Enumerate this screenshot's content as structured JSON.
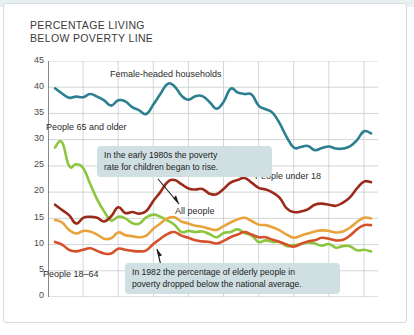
{
  "title": "PERCENTAGE LIVING\nBELOW POVERTY LINE",
  "series_labels": {
    "female": "Female-headed households",
    "elderly": "People 65 and older",
    "under18": "People under 18",
    "all": "All people",
    "adults": "People 18–64"
  },
  "callouts": {
    "one": "In the early 1980s the poverty\nrate for children began to rise.",
    "two": "In 1982 the percentage of elderly people in\npoverty dropped below the national average."
  },
  "chart_data": {
    "type": "line",
    "title": "PERCENTAGE LIVING BELOW POVERTY LINE",
    "xlabel": "",
    "ylabel": "",
    "xlim": [
      1965,
      2012
    ],
    "ylim": [
      0,
      45
    ],
    "yticks": [
      0,
      5,
      10,
      15,
      20,
      25,
      30,
      35,
      40,
      45
    ],
    "xticks": [
      1965,
      1970,
      1975,
      1980,
      1985,
      1990,
      1995,
      2000,
      2005,
      2010
    ],
    "grid": true,
    "legend": "inline-labels",
    "colors": {
      "female": "#2b7f8f",
      "elderly": "#8cc63f",
      "under18": "#9c2a1a",
      "all": "#e8a33d",
      "adults": "#d4512a"
    },
    "x": [
      1966,
      1967,
      1968,
      1969,
      1970,
      1971,
      1972,
      1973,
      1974,
      1975,
      1976,
      1977,
      1978,
      1979,
      1980,
      1981,
      1982,
      1983,
      1984,
      1985,
      1986,
      1987,
      1988,
      1989,
      1990,
      1991,
      1992,
      1993,
      1994,
      1995,
      1996,
      1997,
      1998,
      1999,
      2000,
      2001,
      2002,
      2003,
      2004,
      2005,
      2006,
      2007,
      2008,
      2009,
      2010,
      2011
    ],
    "series": [
      {
        "name": "Female-headed households",
        "color": "#2b7f8f",
        "values": [
          39.8,
          38.8,
          38.0,
          38.2,
          38.1,
          38.7,
          38.2,
          37.5,
          36.5,
          37.5,
          37.3,
          36.2,
          35.6,
          34.9,
          36.7,
          38.7,
          40.6,
          40.2,
          38.4,
          37.6,
          38.3,
          38.3,
          37.2,
          35.9,
          37.2,
          39.7,
          39.0,
          38.7,
          38.6,
          36.5,
          35.8,
          35.1,
          33.1,
          30.5,
          28.5,
          28.6,
          28.8,
          28.0,
          28.4,
          28.7,
          28.3,
          28.3,
          28.7,
          29.9,
          31.6,
          31.2
        ]
      },
      {
        "name": "People 65 and older",
        "color": "#8cc63f",
        "values": [
          28.5,
          29.5,
          25.0,
          25.3,
          24.6,
          21.6,
          18.6,
          16.3,
          14.6,
          15.3,
          15.0,
          14.1,
          14.0,
          15.2,
          15.7,
          15.3,
          14.6,
          13.8,
          12.4,
          12.6,
          12.4,
          12.5,
          12.0,
          11.4,
          12.2,
          12.4,
          12.9,
          12.2,
          11.7,
          10.5,
          10.8,
          10.5,
          10.5,
          9.7,
          9.9,
          10.1,
          10.4,
          10.2,
          9.8,
          10.1,
          9.4,
          9.7,
          9.7,
          8.9,
          9.0,
          8.7
        ]
      },
      {
        "name": "People under 18",
        "color": "#9c2a1a",
        "values": [
          17.6,
          16.6,
          15.6,
          14.0,
          15.1,
          15.3,
          15.1,
          14.4,
          15.4,
          17.1,
          16.0,
          16.2,
          15.9,
          16.4,
          18.3,
          20.0,
          21.9,
          22.3,
          21.5,
          20.7,
          20.5,
          20.6,
          19.7,
          19.6,
          20.6,
          21.8,
          22.3,
          22.7,
          21.8,
          20.8,
          20.5,
          19.9,
          18.9,
          16.9,
          16.2,
          16.3,
          16.7,
          17.6,
          17.8,
          17.6,
          17.4,
          18.0,
          19.0,
          20.7,
          22.0,
          21.9
        ]
      },
      {
        "name": "All people",
        "color": "#e8a33d",
        "values": [
          14.7,
          14.2,
          12.8,
          12.1,
          12.6,
          12.5,
          11.9,
          11.1,
          11.2,
          12.3,
          11.8,
          11.6,
          11.4,
          11.7,
          13.0,
          14.0,
          15.0,
          15.2,
          14.4,
          14.0,
          13.6,
          13.4,
          13.0,
          12.8,
          13.5,
          14.2,
          14.8,
          15.1,
          14.5,
          13.8,
          13.7,
          13.3,
          12.7,
          11.9,
          11.3,
          11.7,
          12.1,
          12.5,
          12.7,
          12.6,
          12.3,
          12.5,
          13.2,
          14.3,
          15.1,
          15.0
        ]
      },
      {
        "name": "People 18–64",
        "color": "#d4512a",
        "values": [
          10.5,
          10.0,
          9.0,
          8.7,
          9.0,
          9.3,
          8.8,
          8.3,
          8.3,
          9.2,
          9.0,
          8.8,
          8.7,
          8.9,
          10.1,
          11.1,
          12.0,
          12.4,
          11.7,
          11.3,
          10.8,
          10.6,
          10.5,
          10.2,
          10.7,
          11.4,
          11.9,
          12.4,
          11.9,
          11.4,
          11.4,
          10.9,
          10.5,
          10.0,
          9.6,
          10.1,
          10.6,
          10.8,
          11.3,
          11.1,
          10.8,
          10.9,
          11.7,
          12.9,
          13.7,
          13.7
        ]
      }
    ]
  }
}
